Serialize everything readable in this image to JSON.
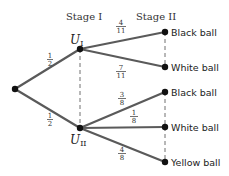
{
  "diagram": {
    "type": "probability-tree",
    "stages": [
      {
        "label": "Stage I"
      },
      {
        "label": "Stage II"
      }
    ],
    "root": {
      "x": 15,
      "y": 89
    },
    "first_level": [
      {
        "id": "UI",
        "label_main": "U",
        "label_sub": "I",
        "x": 80,
        "y": 49,
        "edge_prob": {
          "num": "1",
          "den": "2"
        }
      },
      {
        "id": "UII",
        "label_main": "U",
        "label_sub": "II",
        "x": 80,
        "y": 128,
        "edge_prob": {
          "num": "1",
          "den": "2"
        }
      }
    ],
    "leaves": [
      {
        "parent": "UI",
        "label": "Black ball",
        "x": 165,
        "y": 32,
        "prob": {
          "num": "4",
          "den": "11"
        }
      },
      {
        "parent": "UI",
        "label": "White ball",
        "x": 165,
        "y": 67,
        "prob": {
          "num": "7",
          "den": "11"
        }
      },
      {
        "parent": "UII",
        "label": "Black ball",
        "x": 165,
        "y": 92,
        "prob": {
          "num": "3",
          "den": "8"
        }
      },
      {
        "parent": "UII",
        "label": "White ball",
        "x": 165,
        "y": 127,
        "prob": {
          "num": "1",
          "den": "8"
        }
      },
      {
        "parent": "UII",
        "label": "Yellow ball",
        "x": 165,
        "y": 162,
        "prob": {
          "num": "4",
          "den": "8"
        }
      }
    ]
  },
  "colors": {
    "edge": "#5a5a5a",
    "node": "#111111",
    "text": "#222222"
  }
}
